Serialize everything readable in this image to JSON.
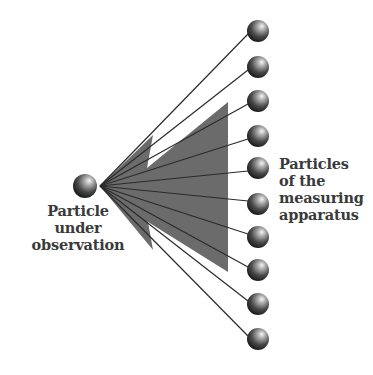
{
  "diagram": {
    "source_particle": {
      "label_lines": [
        "Particle",
        "under",
        "observation"
      ],
      "cx": 85,
      "cy": 186,
      "r": 12
    },
    "apparatus": {
      "label_lines": [
        "Particles",
        "of the",
        "measuring",
        "apparatus"
      ],
      "particles": [
        {
          "cx": 258,
          "cy": 31
        },
        {
          "cx": 258,
          "cy": 67
        },
        {
          "cx": 258,
          "cy": 101
        },
        {
          "cx": 258,
          "cy": 136
        },
        {
          "cx": 258,
          "cy": 168
        },
        {
          "cx": 258,
          "cy": 204
        },
        {
          "cx": 258,
          "cy": 237
        },
        {
          "cx": 258,
          "cy": 270
        },
        {
          "cx": 258,
          "cy": 304
        },
        {
          "cx": 258,
          "cy": 339
        }
      ],
      "particle_radius": 11
    },
    "fan_apex": {
      "x": 100,
      "y": 186
    },
    "wedge_color": "#6b6b6b",
    "line_color": "#2b2b2b"
  }
}
